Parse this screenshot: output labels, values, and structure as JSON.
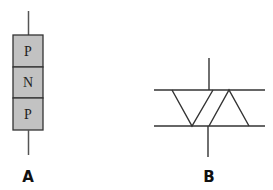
{
  "figure": {
    "diagram_a": {
      "label": "A",
      "layers": [
        {
          "text": "P"
        },
        {
          "text": "N"
        },
        {
          "text": "P"
        }
      ],
      "fill_color": "#c2c2c2",
      "stroke_color": "#333333"
    },
    "diagram_b": {
      "label": "B",
      "stroke_color": "#333333"
    }
  }
}
